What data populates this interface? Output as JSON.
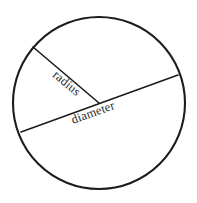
{
  "figure": {
    "background_color": "#ffffff",
    "stroke_color": "#1c1c1c",
    "text_color": "#2a2a2a"
  },
  "labels": {
    "radius": "radius",
    "diameter": "diameter"
  },
  "chart_data": {
    "type": "diagram",
    "shape": "circle",
    "title": "",
    "circle": {
      "center_x": 99,
      "center_y": 103,
      "radius": 86,
      "stroke_width": 2.1,
      "fill": "none"
    },
    "segments": [
      {
        "name": "radius",
        "label": "radius",
        "x1": 99,
        "y1": 103,
        "x2": 33,
        "y2": 47,
        "stroke_width": 1.6,
        "label_x": 52,
        "label_y": 76,
        "label_rotation_deg": 40
      },
      {
        "name": "diameter",
        "label": "diameter",
        "x1": 21,
        "y1": 132,
        "x2": 178,
        "y2": 75,
        "stroke_width": 1.6,
        "label_x": 73,
        "label_y": 124,
        "label_rotation_deg": -20
      }
    ],
    "grid": false,
    "legend": false,
    "axis": false
  }
}
